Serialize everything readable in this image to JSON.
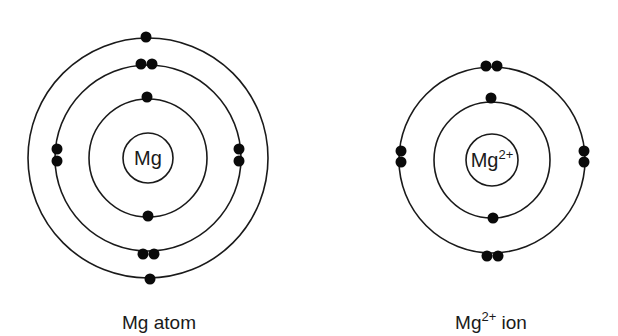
{
  "colors": {
    "background": "#ffffff",
    "line": "#1a1a1a",
    "electron": "#0a0a0a"
  },
  "diagrams": [
    {
      "id": "mg-atom",
      "nucleus_symbol": "Mg",
      "nucleus_charge": "",
      "caption_symbol": "Mg",
      "caption_charge": "",
      "caption_suffix": " atom",
      "center": [
        148,
        158
      ],
      "nucleus_radius": 25,
      "shells": [
        {
          "radius": 59,
          "electron_count": 2,
          "electrons": [
            [
              147,
              97
            ],
            [
              148,
              216
            ]
          ]
        },
        {
          "radius": 93,
          "electron_count": 8,
          "electrons": [
            [
              141,
              64
            ],
            [
              152,
              64
            ],
            [
              57,
              149
            ],
            [
              57,
              161
            ],
            [
              239,
              149
            ],
            [
              239,
              161
            ],
            [
              143,
              254
            ],
            [
              154,
              254
            ]
          ]
        },
        {
          "radius": 120,
          "electron_count": 2,
          "electrons": [
            [
              146,
              37
            ],
            [
              150,
              279
            ]
          ]
        }
      ],
      "electron_configuration": "2,8,2"
    },
    {
      "id": "mg2plus-ion",
      "nucleus_symbol": "Mg",
      "nucleus_charge": "2+",
      "caption_symbol": "Mg",
      "caption_charge": "2+",
      "caption_suffix": " ion",
      "center": [
        492,
        160
      ],
      "nucleus_radius": 26,
      "shells": [
        {
          "radius": 58,
          "electron_count": 2,
          "electrons": [
            [
              491,
              98
            ],
            [
              493,
              218
            ]
          ]
        },
        {
          "radius": 93,
          "electron_count": 8,
          "electrons": [
            [
              486,
              66
            ],
            [
              497,
              66
            ],
            [
              401,
              151
            ],
            [
              401,
              162
            ],
            [
              584,
              151
            ],
            [
              584,
              162
            ],
            [
              487,
              256
            ],
            [
              498,
              256
            ]
          ]
        }
      ],
      "electron_configuration": "2,8"
    }
  ]
}
